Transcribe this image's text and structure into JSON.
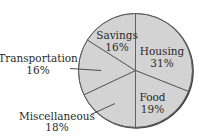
{
  "chart_data": {
    "type": "pie",
    "title": "",
    "start_angle_deg": 0,
    "direction": "clockwise",
    "slices": [
      {
        "label": "Housing",
        "value": 31,
        "display": "31%"
      },
      {
        "label": "Food",
        "value": 19,
        "display": "19%"
      },
      {
        "label": "Miscellaneous",
        "value": 18,
        "display": "18%"
      },
      {
        "label": "Transportation",
        "value": 16,
        "display": "16%"
      },
      {
        "label": "Savings",
        "value": 16,
        "display": "16%"
      }
    ],
    "categories": [
      "Housing",
      "Food",
      "Miscellaneous",
      "Transportation",
      "Savings"
    ],
    "values": [
      31,
      19,
      18,
      16,
      16
    ],
    "units": "%",
    "legend": "none (labels placed on/near slices)"
  },
  "labels": {
    "housing": {
      "name": "Housing",
      "pct": "31%"
    },
    "food": {
      "name": "Food",
      "pct": "19%"
    },
    "miscellaneous": {
      "name": "Miscellaneous",
      "pct": "18%"
    },
    "transportation": {
      "name": "Transportation",
      "pct": "16%"
    },
    "savings": {
      "name": "Savings",
      "pct": "16%"
    }
  },
  "colors": {
    "slice_fill": "#d3d3d3",
    "slice_stroke": "#5a5a5a",
    "rim_shadow": "#3c3c3c",
    "text": "#2a2a2a"
  }
}
